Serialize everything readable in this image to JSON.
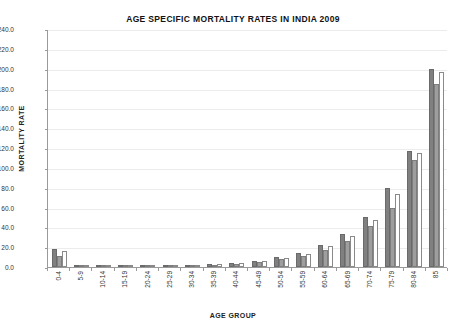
{
  "chart_data": {
    "type": "bar",
    "title": "AGE SPECIFIC MORTALITY RATES IN INDIA 2009",
    "xlabel": "AGE GROUP",
    "ylabel": "MORTALITY RATE",
    "ylim": [
      0,
      240
    ],
    "ytick_step": 20,
    "ytick_labels": [
      "0.0",
      "20.0",
      "40.0",
      "60.0",
      "80.0",
      "100.0",
      "120.0",
      "140.0",
      "160.0",
      "180.0",
      "200.0",
      "220.0",
      "240.0"
    ],
    "grid": true,
    "legend_position": "top-center",
    "annotation": [
      "Per",
      "1000",
      "births"
    ],
    "categories": [
      "0-4",
      "5-9",
      "10-14",
      "15-19",
      "20-24",
      "25-29",
      "30-34",
      "35-39",
      "40-44",
      "45-49",
      "50-54",
      "55-59",
      "60-64",
      "65-69",
      "70-74",
      "75-79",
      "80-84",
      "85"
    ],
    "series": [
      {
        "name": "Rural",
        "color": "#808080",
        "values": [
          18.0,
          1.4,
          0.7,
          1.1,
          1.6,
          1.9,
          2.3,
          3.2,
          4.4,
          6.5,
          9.8,
          14.6,
          22.5,
          33.0,
          50.0,
          80.0,
          117.0,
          200.0
        ]
      },
      {
        "name": "Urban",
        "color": "#9e9e9e",
        "values": [
          11.0,
          0.9,
          0.5,
          0.8,
          1.2,
          1.3,
          1.7,
          2.4,
          3.4,
          5.2,
          7.6,
          11.2,
          17.5,
          26.5,
          41.0,
          60.0,
          108.0,
          185.0
        ]
      },
      {
        "name": "Combined",
        "color": "#ffffff",
        "values": [
          16.0,
          1.3,
          0.6,
          1.0,
          1.5,
          1.7,
          2.1,
          3.0,
          4.1,
          6.1,
          9.2,
          13.6,
          21.0,
          31.0,
          47.0,
          74.0,
          115.0,
          197.0
        ]
      }
    ]
  },
  "legend": {
    "items": [
      {
        "label": "Rural",
        "swatch": "rural"
      },
      {
        "label": "Urban",
        "swatch": "urban"
      },
      {
        "label": "Combined",
        "swatch": "combined"
      }
    ]
  }
}
